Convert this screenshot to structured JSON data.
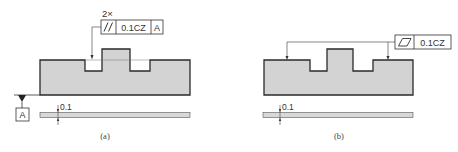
{
  "colors": {
    "part_fill": "#d3d3d3",
    "outline": "#2a2a2a",
    "leader": "#555555",
    "datum_fill": "#222222",
    "band_fill": "#d8d8d8"
  },
  "panel_a": {
    "caption": "(a)",
    "multiplier": "2×",
    "frame": {
      "symbol": "//",
      "symbol_name": "parallelism",
      "tolerance": "0.1CZ",
      "datum": "A"
    },
    "datum_label": "A",
    "zone_label": "0.1"
  },
  "panel_b": {
    "caption": "(b)",
    "frame": {
      "symbol": "▱",
      "symbol_name": "flatness",
      "tolerance": "0.1CZ"
    },
    "zone_label": "0.1"
  }
}
